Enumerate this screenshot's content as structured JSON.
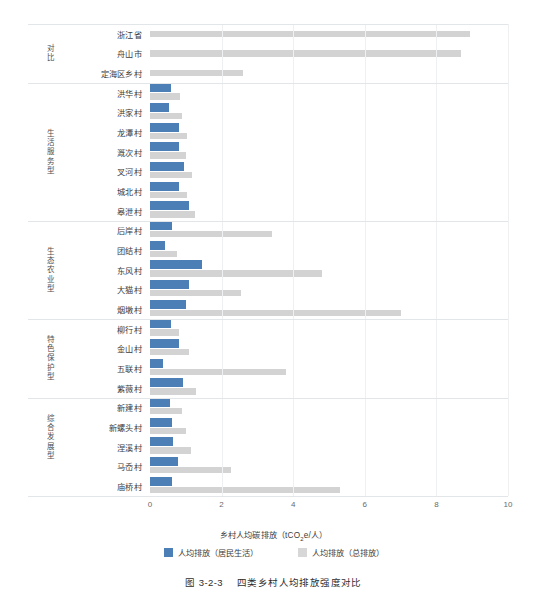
{
  "figure": {
    "caption_number": "图 3-2-3",
    "caption_title": "四类乡村人均排放强度对比"
  },
  "legend": {
    "position": "bottom-center",
    "items": [
      {
        "label": "人均排放（居民生活）",
        "color": "#4b7fb5",
        "key": "residential"
      },
      {
        "label": "人均排放（总排放）",
        "color": "#d7d7d7",
        "key": "total"
      }
    ]
  },
  "axis": {
    "title_main": "乡村人均碳排放（tCO",
    "title_sub": "2",
    "title_tail": "e/人）",
    "ticks": [
      "0",
      "2",
      "4",
      "6",
      "8",
      "10"
    ]
  },
  "groups": [
    {
      "label": "对比",
      "count": 3
    },
    {
      "label": "生活服务型",
      "count": 7
    },
    {
      "label": "生态农业型",
      "count": 5
    },
    {
      "label": "特色保护型",
      "count": 4
    },
    {
      "label": "综合发展型",
      "count": 4
    }
  ],
  "chart_data": {
    "type": "bar",
    "orientation": "horizontal",
    "xlabel": "乡村人均碳排放（tCO2e/人）",
    "ylabel": "",
    "xlim": [
      0,
      10
    ],
    "xticks": [
      0,
      2,
      4,
      6,
      8,
      10
    ],
    "grid": true,
    "legend_position": "bottom-center",
    "categories": [
      "浙江省",
      "舟山市",
      "定海区乡村",
      "洪华村",
      "洪家村",
      "龙潭村",
      "溉次村",
      "叉河村",
      "城北村",
      "皋泄村",
      "后岸村",
      "团结村",
      "东风村",
      "大猫村",
      "烟墩村",
      "柳行村",
      "金山村",
      "五联村",
      "紫薇村",
      "新建村",
      "新螺头村",
      "涅溪村",
      "马岙村",
      "庙桥村"
    ],
    "group_of_category": [
      "对比",
      "对比",
      "对比",
      "生活服务型",
      "生活服务型",
      "生活服务型",
      "生活服务型",
      "生活服务型",
      "生活服务型",
      "生活服务型",
      "生态农业型",
      "生态农业型",
      "生态农业型",
      "生态农业型",
      "生态农业型",
      "特色保护型",
      "特色保护型",
      "特色保护型",
      "特色保护型",
      "综合发展型",
      "综合发展型",
      "综合发展型",
      "综合发展型"
    ],
    "series": [
      {
        "name": "人均排放（居民生活）",
        "color": "#4b7fb5",
        "values": [
          null,
          null,
          null,
          0.6,
          0.52,
          0.82,
          0.8,
          0.95,
          0.8,
          1.1,
          0.62,
          0.42,
          1.45,
          1.1,
          1.0,
          0.6,
          0.82,
          0.35,
          0.92,
          0.55,
          0.62,
          0.65,
          0.78,
          0.62
        ]
      },
      {
        "name": "人均排放（总排放）",
        "color": "#d3d3d3",
        "values": [
          8.95,
          8.7,
          2.6,
          0.85,
          0.9,
          1.02,
          1.0,
          1.18,
          1.02,
          1.25,
          3.4,
          0.75,
          4.8,
          2.55,
          7.0,
          0.8,
          1.1,
          3.8,
          1.28,
          0.88,
          1.0,
          1.15,
          2.25,
          5.3
        ]
      }
    ]
  }
}
